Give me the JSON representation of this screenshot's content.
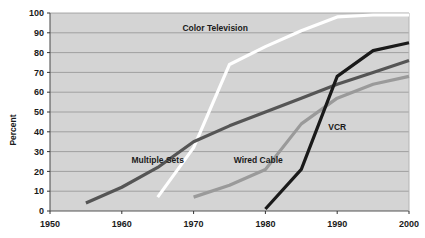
{
  "chart_data": {
    "type": "line",
    "title": "",
    "subtitle": "",
    "xlabel": "",
    "ylabel": "Percent",
    "xlim": [
      1950,
      2000
    ],
    "ylim": [
      0,
      100
    ],
    "xticks": [
      1950,
      1960,
      1970,
      1980,
      1990,
      2000
    ],
    "yticks": [
      0,
      10,
      20,
      30,
      40,
      50,
      60,
      70,
      80,
      90,
      100
    ],
    "xtick_labels": [
      "1950",
      "1960",
      "1970",
      "1980",
      "1990",
      "2000"
    ],
    "ytick_labels": [
      "0",
      "10",
      "20",
      "30",
      "40",
      "50",
      "60",
      "70",
      "80",
      "90",
      "100"
    ],
    "grid": "horizontal",
    "legend": "inline-annotations",
    "plot_background": "#d4d4d4",
    "page_background": "#ffffff",
    "series": [
      {
        "name": "Color Television",
        "color": "#ffffff",
        "label_x": 1973,
        "label_y": 91,
        "x": [
          1965,
          1970,
          1975,
          1980,
          1985,
          1990,
          1995,
          2000
        ],
        "values": [
          7,
          32,
          74,
          83,
          91,
          98,
          99,
          99
        ]
      },
      {
        "name": "Multiple Sets",
        "color": "#555555",
        "label_x": 1965,
        "label_y": 24,
        "x": [
          1955,
          1960,
          1965,
          1970,
          1975,
          1980,
          1985,
          1990,
          1995,
          2000
        ],
        "values": [
          4,
          12,
          22,
          35,
          43,
          50,
          57,
          64,
          70,
          76
        ]
      },
      {
        "name": "Wired Cable",
        "color": "#9a9a9a",
        "label_x": 1979,
        "label_y": 24,
        "x": [
          1970,
          1975,
          1980,
          1985,
          1990,
          1995,
          2000
        ],
        "values": [
          7,
          13,
          21,
          44,
          57,
          64,
          68
        ]
      },
      {
        "name": "VCR",
        "color": "#1a1a1a",
        "label_x": 1990,
        "label_y": 41,
        "x": [
          1980,
          1985,
          1990,
          1995,
          2000
        ],
        "values": [
          1,
          21,
          68,
          81,
          85
        ]
      }
    ]
  }
}
